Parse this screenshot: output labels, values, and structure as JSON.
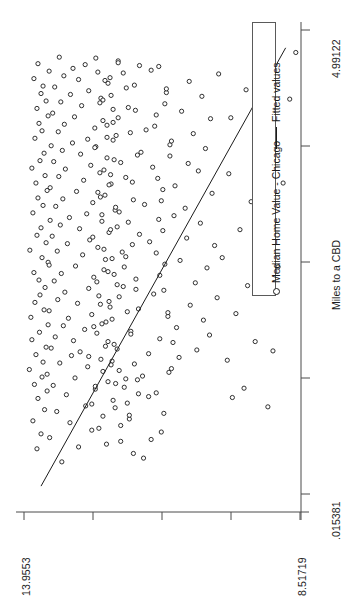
{
  "figure": {
    "background": "#ffffff",
    "ink": "#1b1b1b",
    "axis_color": "#4a4a4a",
    "orientation": "rotated-90-ccw"
  },
  "legend": {
    "entries": [
      {
        "label": "Median Home Value - Chicago",
        "marker": "open-circle-marker"
      },
      {
        "label": "Fitted values",
        "marker": "line-marker"
      }
    ]
  },
  "axes": {
    "x": {
      "title": "Miles to a CBD",
      "tick_labels": [
        ".015381",
        "4.99122"
      ],
      "min_label": ".015381",
      "max_label": "4.99122",
      "n_ticks": 5
    },
    "y": {
      "title": "",
      "tick_labels": [
        "8.51719",
        "13.9553"
      ],
      "min_label": "8.51719",
      "max_label": "13.9553",
      "n_ticks": 5
    }
  },
  "chart_data": {
    "type": "scatter",
    "title": "",
    "xlabel": "Miles to a CBD",
    "ylabel": "Median Home Value - Chicago",
    "xlim": [
      0.015381,
      4.99122
    ],
    "ylim": [
      8.51719,
      13.9553
    ],
    "grid": false,
    "legend_position": "right",
    "xtick_labels": [
      ".015381",
      "4.99122"
    ],
    "ytick_labels": [
      "8.51719",
      "13.9553"
    ],
    "series": [
      {
        "name": "Median Home Value - Chicago",
        "marker": "open-circle",
        "x": [
          0.36,
          0.52,
          0.62,
          0.7,
          0.78,
          0.85,
          0.9,
          0.96,
          1.02,
          1.08,
          1.14,
          1.18,
          1.22,
          1.26,
          1.3,
          1.34,
          1.38,
          1.42,
          1.46,
          1.5,
          1.54,
          1.58,
          1.62,
          1.66,
          1.7,
          1.74,
          1.78,
          1.82,
          1.86,
          1.9,
          1.94,
          1.98,
          2.02,
          2.06,
          2.1,
          2.14,
          2.18,
          2.22,
          2.26,
          2.3,
          2.34,
          2.38,
          2.42,
          2.46,
          2.5,
          2.54,
          2.58,
          2.62,
          2.66,
          2.7,
          2.74,
          2.78,
          2.82,
          2.86,
          2.9,
          2.94,
          2.98,
          3.02,
          3.06,
          3.1,
          3.14,
          3.18,
          3.22,
          3.26,
          3.3,
          3.34,
          3.38,
          3.42,
          3.46,
          3.5,
          3.54,
          3.58,
          3.62,
          3.66,
          3.7,
          3.74,
          3.78,
          3.82,
          3.86,
          3.9,
          3.94,
          3.98,
          4.02,
          4.06,
          4.1,
          4.14,
          4.18,
          4.22,
          4.26,
          4.3,
          4.34,
          4.38,
          4.42,
          4.46,
          4.5,
          4.54,
          4.58,
          4.62,
          4.66,
          4.7,
          0.45,
          0.6,
          0.75,
          0.88,
          0.99,
          1.1,
          1.2,
          1.28,
          1.36,
          1.44,
          1.52,
          1.6,
          1.68,
          1.76,
          1.84,
          1.92,
          2.0,
          2.08,
          2.16,
          2.24,
          2.32,
          2.4,
          2.48,
          2.56,
          2.64,
          2.72,
          2.8,
          2.88,
          2.96,
          3.04,
          3.12,
          3.2,
          3.28,
          3.36,
          3.44,
          3.52,
          3.6,
          3.68,
          3.76,
          3.84,
          3.92,
          4.0,
          4.08,
          4.16,
          4.24,
          4.32,
          4.4,
          4.48,
          4.56,
          4.64,
          0.4,
          0.55,
          0.68,
          0.82,
          0.94,
          1.06,
          1.16,
          1.24,
          1.32,
          1.4,
          1.48,
          1.56,
          1.64,
          1.72,
          1.8,
          1.88,
          1.96,
          2.04,
          2.12,
          2.2,
          2.28,
          2.36,
          2.44,
          2.52,
          2.6,
          2.68,
          2.76,
          2.84,
          2.92,
          3.0,
          3.08,
          3.16,
          3.24,
          3.32,
          3.4,
          3.48,
          3.56,
          3.64,
          3.72,
          3.8,
          3.88,
          3.96,
          4.04,
          4.12,
          4.2,
          4.28,
          4.36,
          4.44,
          4.52,
          4.6,
          0.5,
          0.66,
          0.8,
          0.92,
          1.04,
          1.12,
          1.19,
          1.27,
          1.35,
          1.43,
          1.51,
          1.59,
          1.67,
          1.75,
          1.83,
          1.91,
          1.99,
          2.07,
          2.15,
          2.23,
          2.31,
          2.39,
          2.47,
          2.55,
          2.63,
          2.71,
          2.79,
          2.87,
          2.95,
          3.03,
          3.11,
          3.19,
          3.27,
          3.35,
          3.43,
          3.51,
          3.59,
          3.67,
          3.75,
          3.83,
          3.91,
          3.99,
          4.07,
          4.15,
          4.23,
          4.31,
          4.39,
          4.47,
          4.55,
          4.63,
          0.58,
          0.72,
          0.86,
          0.98,
          1.09,
          1.17,
          1.25,
          1.33,
          1.41,
          1.49,
          1.57,
          1.65,
          1.73,
          1.81,
          1.89,
          1.97,
          2.05,
          2.13,
          2.21,
          2.29,
          2.37,
          2.45,
          2.53,
          2.61,
          2.69,
          2.77,
          2.85,
          2.93,
          3.01,
          3.09,
          3.17,
          3.25,
          3.33,
          3.41,
          3.49,
          3.57,
          3.65,
          3.73,
          3.81,
          3.89,
          3.97,
          4.05,
          4.13,
          4.21,
          4.29,
          4.37,
          4.45,
          4.53,
          4.61,
          4.69,
          1.05,
          1.15,
          1.45,
          1.65,
          1.95,
          2.25,
          2.55,
          2.85,
          3.15,
          3.45,
          3.75,
          4.05,
          4.35,
          4.65,
          0.95,
          1.55,
          2.45,
          3.35,
          4.25,
          4.75
        ],
        "y": [
          13.21,
          12.88,
          13.45,
          12.62,
          13.05,
          12.4,
          13.31,
          12.74,
          12.2,
          13.12,
          12.55,
          13.38,
          12.3,
          12.95,
          13.5,
          12.08,
          12.7,
          13.25,
          12.44,
          13.02,
          12.85,
          13.42,
          12.18,
          12.98,
          13.34,
          12.52,
          12.76,
          13.18,
          12.34,
          13.08,
          12.62,
          13.46,
          12.26,
          12.9,
          13.29,
          12.48,
          13.15,
          12.68,
          12.12,
          13.36,
          12.58,
          13.22,
          12.38,
          12.94,
          13.48,
          12.22,
          12.8,
          13.3,
          12.5,
          13.1,
          12.66,
          13.4,
          12.28,
          12.86,
          13.24,
          12.42,
          13.06,
          12.72,
          12.16,
          13.33,
          12.6,
          13.19,
          12.36,
          12.92,
          13.44,
          12.24,
          12.78,
          13.27,
          12.46,
          13.14,
          12.64,
          13.37,
          12.32,
          12.84,
          13.2,
          12.54,
          13.0,
          12.7,
          12.14,
          13.28,
          12.56,
          13.16,
          12.4,
          12.96,
          13.39,
          12.2,
          12.82,
          13.23,
          12.44,
          13.04,
          12.68,
          13.35,
          12.3,
          12.88,
          13.17,
          12.5,
          12.99,
          12.75,
          12.1,
          13.26,
          11.8,
          11.45,
          12.05,
          11.2,
          11.92,
          11.35,
          12.15,
          11.62,
          11.05,
          12.22,
          11.5,
          12.35,
          11.28,
          11.85,
          12.42,
          11.12,
          11.7,
          12.28,
          11.4,
          12.0,
          11.75,
          12.3,
          11.18,
          11.95,
          12.38,
          11.48,
          11.68,
          12.12,
          11.3,
          12.08,
          11.58,
          12.45,
          11.22,
          11.82,
          12.25,
          11.42,
          12.18,
          11.65,
          11.08,
          12.32,
          11.55,
          12.2,
          11.35,
          11.9,
          12.4,
          11.15,
          11.78,
          12.26,
          11.45,
          12.1,
          11.6,
          12.33,
          11.25,
          11.88,
          12.16,
          11.5,
          11.98,
          11.72,
          11.1,
          12.24,
          10.9,
          10.55,
          11.02,
          10.3,
          10.95,
          10.42,
          11.12,
          10.68,
          10.15,
          11.2,
          10.58,
          11.28,
          10.35,
          10.88,
          11.35,
          10.2,
          10.75,
          11.22,
          10.48,
          11.0,
          10.78,
          11.25,
          10.25,
          10.98,
          11.32,
          10.52,
          10.72,
          11.08,
          10.38,
          11.05,
          10.62,
          11.38,
          10.28,
          10.85,
          11.18,
          10.45,
          11.15,
          10.7,
          10.12,
          11.3,
          13.7,
          13.62,
          13.78,
          13.55,
          13.68,
          13.5,
          13.75,
          13.6,
          13.85,
          13.58,
          13.72,
          13.52,
          13.8,
          13.65,
          13.48,
          13.82,
          13.56,
          13.74,
          13.64,
          13.54,
          13.66,
          13.76,
          13.46,
          13.6,
          13.84,
          13.52,
          13.7,
          13.62,
          13.44,
          13.78,
          13.58,
          13.68,
          13.5,
          13.72,
          13.54,
          13.8,
          13.64,
          13.56,
          13.42,
          13.74,
          13.6,
          13.66,
          13.48,
          13.7,
          13.52,
          13.62,
          13.58,
          13.76,
          13.46,
          13.68,
          12.05,
          12.48,
          11.88,
          12.62,
          11.7,
          12.55,
          11.95,
          12.4,
          11.78,
          12.68,
          12.12,
          12.3,
          11.85,
          12.58,
          12.22,
          11.92,
          12.45,
          12.08,
          11.75,
          12.52,
          12.18,
          11.98,
          12.35,
          12.02,
          11.82,
          12.6,
          12.25,
          11.9,
          12.42,
          12.15,
          11.8,
          12.5,
          12.28,
          11.95,
          12.38,
          12.05,
          11.72,
          12.56,
          12.2,
          11.86,
          12.32,
          12.1,
          11.76,
          12.46,
          12.24,
          11.94,
          12.36,
          12.0,
          11.68,
          12.54,
          9.85,
          9.62,
          9.95,
          9.4,
          9.78,
          9.55,
          10.05,
          9.7,
          9.48,
          9.92,
          9.35,
          9.88,
          9.58,
          9.25,
          9.15,
          9.05,
          8.95,
          8.85,
          8.72,
          8.6
        ],
        "n_points": 380
      }
    ],
    "fit_line": {
      "name": "Fitted values",
      "type": "linear",
      "x": [
        0.1,
        4.8
      ],
      "y": [
        13.62,
        8.8
      ]
    }
  }
}
